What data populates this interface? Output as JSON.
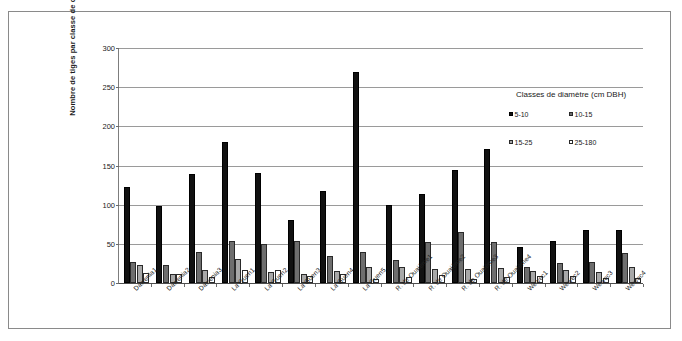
{
  "chart_data": {
    "type": "bar",
    "title": "",
    "xlabel": "",
    "ylabel": "Nombre de tiges par classe de diamètre",
    "ylim": [
      0,
      300
    ],
    "yticks": [
      0,
      50,
      100,
      150,
      200,
      250,
      300
    ],
    "grid": true,
    "legend_position": "upper-right",
    "legend_title": "Classes de diamètre (cm DBH)",
    "categories": [
      "Dawenia1",
      "Dawenia2",
      "Dawenia3",
      "La Guen1",
      "La Guen2",
      "La Guen3",
      "La Guen4",
      "La Guen5",
      "R. de Ouaième1",
      "R. de Ouaième2",
      "R. de Ouaième3",
      "R. de Ouaième4",
      "Wewec1",
      "Wewec2",
      "Wewec3",
      "Wewec4"
    ],
    "series": [
      {
        "name": "5-10",
        "color": "#111111",
        "values": [
          123,
          98,
          139,
          180,
          140,
          81,
          117,
          269,
          100,
          114,
          144,
          171,
          46,
          54,
          68,
          68
        ]
      },
      {
        "name": "10-15",
        "color": "#6e6e6e",
        "values": [
          27,
          23,
          39,
          53,
          50,
          53,
          34,
          40,
          29,
          52,
          65,
          52,
          21,
          25,
          27,
          38
        ]
      },
      {
        "name": "15-25",
        "color": "#a8a8a8",
        "values": [
          23,
          11,
          16,
          31,
          14,
          11,
          15,
          20,
          20,
          18,
          18,
          19,
          15,
          17,
          14,
          21
        ]
      },
      {
        "name": "25-180",
        "color": "#ffffff",
        "values": [
          13,
          12,
          8,
          16,
          16,
          9,
          12,
          5,
          8,
          10,
          5,
          8,
          9,
          9,
          6,
          7
        ]
      }
    ]
  }
}
